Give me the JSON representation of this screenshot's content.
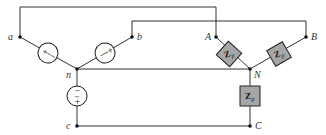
{
  "diagram": {
    "type": "three-phase circuit",
    "source_side": {
      "nodes": {
        "a": "a",
        "b": "b",
        "c": "c",
        "n": "n"
      },
      "sources": [
        {
          "id": "source-a",
          "symbol": "~",
          "plus": "+",
          "minus": "−"
        },
        {
          "id": "source-b",
          "symbol": "~",
          "plus": "+",
          "minus": "−"
        },
        {
          "id": "source-c",
          "symbol": "~",
          "plus": "+",
          "minus": "−"
        }
      ]
    },
    "load_side": {
      "nodes": {
        "A": "A",
        "B": "B",
        "C": "C",
        "N": "N"
      },
      "impedances": [
        {
          "id": "zp-an",
          "label": "Z",
          "subscript": "p"
        },
        {
          "id": "zp-bn",
          "label": "Z",
          "subscript": "p"
        },
        {
          "id": "zp-cn",
          "label": "Z",
          "subscript": "p"
        }
      ]
    },
    "colors": {
      "wire": "#1a1a1a",
      "impedance_fill": "#a6a6a6",
      "label": "#333333"
    }
  }
}
